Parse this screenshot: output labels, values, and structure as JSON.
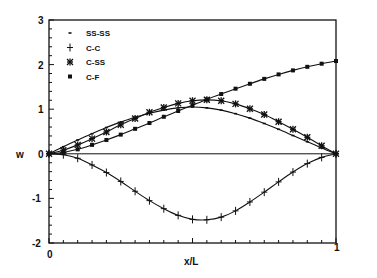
{
  "chart_data": {
    "type": "line",
    "title": "",
    "xlabel": "x/L",
    "ylabel": "w",
    "xlim": [
      0,
      1
    ],
    "ylim": [
      -2,
      3
    ],
    "xticks": [
      "0",
      "1"
    ],
    "yticks": [
      "-2",
      "-1",
      "0",
      "1",
      "2",
      "3"
    ],
    "grid": false,
    "legend_position": "upper-left",
    "x": [
      0,
      0.05,
      0.1,
      0.15,
      0.2,
      0.25,
      0.3,
      0.35,
      0.4,
      0.45,
      0.5,
      0.55,
      0.6,
      0.65,
      0.7,
      0.75,
      0.8,
      0.85,
      0.9,
      0.95,
      1.0
    ],
    "series": [
      {
        "name": "SS-SS",
        "marker": "dash",
        "values": [
          0,
          0.16,
          0.31,
          0.45,
          0.59,
          0.71,
          0.82,
          0.91,
          0.98,
          1.03,
          1.05,
          1.03,
          0.98,
          0.9,
          0.8,
          0.68,
          0.55,
          0.41,
          0.27,
          0.13,
          0
        ]
      },
      {
        "name": "C-C",
        "marker": "plus",
        "values": [
          0,
          -0.02,
          -0.1,
          -0.25,
          -0.42,
          -0.62,
          -0.84,
          -1.05,
          -1.23,
          -1.38,
          -1.47,
          -1.48,
          -1.42,
          -1.28,
          -1.08,
          -0.86,
          -0.63,
          -0.41,
          -0.22,
          -0.08,
          0
        ]
      },
      {
        "name": "C-SS",
        "marker": "asterisk",
        "values": [
          0,
          0.08,
          0.2,
          0.34,
          0.49,
          0.65,
          0.79,
          0.93,
          1.04,
          1.13,
          1.19,
          1.21,
          1.19,
          1.12,
          1.01,
          0.88,
          0.72,
          0.55,
          0.37,
          0.18,
          0
        ]
      },
      {
        "name": "C-F",
        "marker": "square",
        "values": [
          0,
          0.03,
          0.1,
          0.2,
          0.31,
          0.43,
          0.56,
          0.69,
          0.83,
          0.96,
          1.09,
          1.22,
          1.34,
          1.46,
          1.57,
          1.68,
          1.78,
          1.87,
          1.95,
          2.02,
          2.08
        ]
      }
    ]
  },
  "legend": {
    "items": [
      {
        "label": "SS-SS",
        "marker": "dash"
      },
      {
        "label": "C-C",
        "marker": "plus"
      },
      {
        "label": "C-SS",
        "marker": "asterisk"
      },
      {
        "label": "C-F",
        "marker": "square"
      }
    ]
  },
  "axes": {
    "ylabel": "w",
    "xlabel": "x/L",
    "x_tick_0": "0",
    "x_tick_1": "1",
    "y_ticks": [
      "3",
      "2",
      "1",
      "0",
      "-1",
      "-2"
    ]
  },
  "colors": {
    "line": "#111111",
    "background": "#ffffff"
  }
}
